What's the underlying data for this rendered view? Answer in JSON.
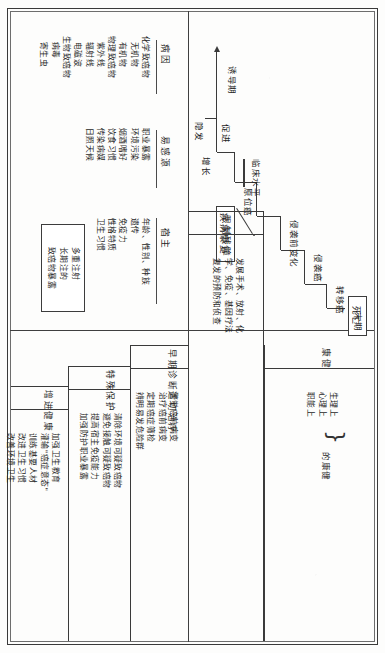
{
  "document": {
    "title": "癌症自然史与三段五级预防图",
    "orientation": "rotated-90"
  },
  "natural_history": {
    "section_name": "疾病自然史",
    "stair_labels": [
      "诱导期",
      "促进",
      "增长",
      "原位癌",
      "侵袭前变化",
      "侵袭癌",
      "转移癌",
      "末期"
    ],
    "clinical_level_label": "临床水平",
    "death_box": "死亡",
    "recovery_box": "疾病康复",
    "start_label": "隐发"
  },
  "host_factors": {
    "columns": [
      {
        "header": "病因",
        "items": "化学致癌物\n  无机物\n  有机物\n物理致癌物\n  紫外线\n  辐射线\n  电磁波\n生物致癌物\n  病毒\n  寄生虫"
      },
      {
        "header": "易感源",
        "items": "职业暴露\n环境污染\n烟酒嗜好\n饮食习惯\n传染病媒\n日照天候"
      },
      {
        "header": "宿主",
        "items": "年龄、性别、种族\n遗传\n免疫力\n性格特质\n卫生习惯"
      }
    ],
    "callout_box": "多重注射\n长期注的\n致癌物暴露"
  },
  "prevention": {
    "levels": [
      {
        "title": "增进健康",
        "items": "加强卫生教育\n灌输\"癌症意态\"\n训练基要人材\n改进卫生习惯\n改善环境卫生"
      },
      {
        "title": "特殊保护",
        "items": "清除环境可疑致癌物\n避免接触可疑致癌物\n提高宿主免疫能力\n加强防护职业暴露"
      },
      {
        "title": "早期诊断适切治疗",
        "items": "警觉癌前病变\n治疗癌前病变\n定期癌症筛检\n辨明易发危险群"
      },
      {
        "title": "限制残障",
        "items": "发展手术、放射、化\n学、免疫、基因疗法\n复发的预防和侦查"
      },
      {
        "title": "康健",
        "items": "生理上\n心理上\n职能上",
        "suffix": "的康健"
      }
    ]
  }
}
